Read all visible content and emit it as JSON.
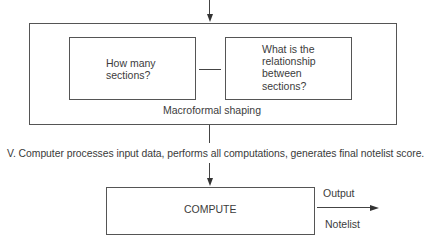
{
  "diagram": {
    "macroformal_block": {
      "title": "Macroformal shaping",
      "left_box": {
        "text": "How many\nsections?"
      },
      "right_box": {
        "text": "What is the\nrelationship\nbetween\nsections?"
      }
    },
    "step_caption": "V. Computer processes input data, performs all computations, generates final notelist score.",
    "compute_box": {
      "label": "COMPUTE"
    },
    "output_arrow": {
      "top_label": "Output",
      "bottom_label": "Notelist"
    },
    "colors": {
      "line": "#444444",
      "text": "#3a3a3a",
      "background": "#ffffff"
    }
  }
}
